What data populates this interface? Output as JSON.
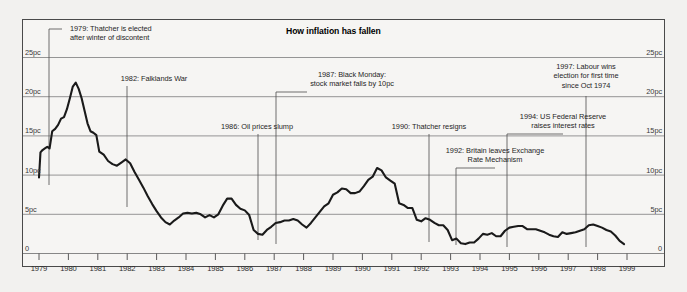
{
  "chart_data": {
    "type": "line",
    "title": "How inflation has fallen",
    "xlabel": "",
    "ylabel": "",
    "ylim": [
      0,
      27
    ],
    "xlim": [
      1979,
      1999.4
    ],
    "grid": true,
    "legend": "none",
    "y_ticks": [
      0,
      5,
      10,
      15,
      20,
      25
    ],
    "y_tick_labels": [
      "0",
      "5pc",
      "10pc",
      "15pc",
      "20pc",
      "25pc"
    ],
    "y_tick_labels_right": [
      "0",
      "5pc",
      "10pc",
      "15pc",
      "20pc",
      "25pc"
    ],
    "x_ticks": [
      1979,
      1980,
      1981,
      1982,
      1983,
      1984,
      1985,
      1986,
      1987,
      1988,
      1989,
      1990,
      1991,
      1992,
      1993,
      1994,
      1995,
      1996,
      1997,
      1998,
      1999
    ],
    "x_tick_labels": [
      "1979",
      "1980",
      "1981",
      "1982",
      "1983",
      "1984",
      "1985",
      "1986",
      "1987",
      "1988",
      "1989",
      "1990",
      "1991",
      "1992",
      "1993",
      "1994",
      "1995",
      "1996",
      "1997",
      "1998",
      "1999"
    ],
    "series": [
      {
        "name": "UK inflation rate",
        "units": "pc",
        "x": [
          1979.0,
          1979.05,
          1979.12,
          1979.2,
          1979.28,
          1979.36,
          1979.45,
          1979.55,
          1979.65,
          1979.75,
          1979.85,
          1979.95,
          1980.05,
          1980.15,
          1980.25,
          1980.35,
          1980.45,
          1980.55,
          1980.65,
          1980.75,
          1980.85,
          1980.95,
          1981.05,
          1981.2,
          1981.35,
          1981.5,
          1981.65,
          1981.8,
          1981.95,
          1982.1,
          1982.25,
          1982.4,
          1982.55,
          1982.7,
          1982.85,
          1983.0,
          1983.15,
          1983.3,
          1983.45,
          1983.6,
          1983.75,
          1983.9,
          1984.05,
          1984.2,
          1984.35,
          1984.5,
          1984.65,
          1984.8,
          1984.95,
          1985.1,
          1985.25,
          1985.4,
          1985.55,
          1985.7,
          1985.85,
          1986.0,
          1986.15,
          1986.3,
          1986.45,
          1986.6,
          1986.75,
          1986.9,
          1987.05,
          1987.2,
          1987.35,
          1987.5,
          1987.65,
          1987.8,
          1987.95,
          1988.1,
          1988.25,
          1988.4,
          1988.55,
          1988.7,
          1988.85,
          1989.0,
          1989.15,
          1989.3,
          1989.45,
          1989.6,
          1989.75,
          1989.9,
          1990.05,
          1990.2,
          1990.35,
          1990.5,
          1990.65,
          1990.8,
          1990.95,
          1991.1,
          1991.25,
          1991.4,
          1991.55,
          1991.7,
          1991.85,
          1992.0,
          1992.15,
          1992.3,
          1992.45,
          1992.6,
          1992.75,
          1992.9,
          1993.05,
          1993.2,
          1993.35,
          1993.5,
          1993.65,
          1993.8,
          1993.95,
          1994.1,
          1994.25,
          1994.4,
          1994.55,
          1994.7,
          1994.85,
          1995.0,
          1995.15,
          1995.3,
          1995.45,
          1995.6,
          1995.75,
          1995.9,
          1996.05,
          1996.2,
          1996.35,
          1996.5,
          1996.65,
          1996.8,
          1996.95,
          1997.1,
          1997.25,
          1997.4,
          1997.55,
          1997.7,
          1997.85,
          1998.0,
          1998.15,
          1998.3,
          1998.45,
          1998.6,
          1998.75,
          1998.9
        ],
        "y": [
          9.7,
          12.9,
          13.2,
          13.4,
          13.6,
          13.4,
          15.6,
          15.9,
          16.4,
          17.2,
          17.4,
          18.4,
          19.8,
          21.3,
          21.8,
          21.0,
          19.8,
          18.2,
          16.6,
          15.6,
          15.4,
          15.1,
          13.0,
          12.6,
          11.8,
          11.4,
          11.2,
          11.6,
          12.0,
          11.5,
          10.4,
          9.4,
          8.4,
          7.3,
          6.3,
          5.4,
          4.6,
          4.0,
          3.7,
          4.2,
          4.6,
          5.1,
          5.2,
          5.1,
          5.2,
          5.0,
          4.6,
          4.9,
          4.6,
          5.0,
          6.1,
          7.0,
          7.0,
          6.2,
          5.7,
          5.5,
          4.9,
          3.0,
          2.5,
          2.4,
          3.0,
          3.4,
          3.9,
          4.0,
          4.2,
          4.2,
          4.4,
          4.2,
          3.7,
          3.3,
          3.9,
          4.6,
          5.3,
          6.0,
          6.4,
          7.5,
          7.8,
          8.3,
          8.2,
          7.7,
          7.7,
          7.9,
          8.6,
          9.4,
          9.8,
          10.9,
          10.6,
          9.7,
          9.3,
          8.9,
          6.4,
          6.2,
          5.8,
          5.8,
          4.3,
          4.1,
          4.5,
          4.3,
          3.9,
          3.6,
          3.6,
          3.0,
          1.7,
          1.9,
          1.3,
          1.2,
          1.4,
          1.4,
          1.9,
          2.5,
          2.4,
          2.6,
          2.2,
          2.2,
          2.9,
          3.3,
          3.4,
          3.5,
          3.5,
          3.1,
          3.1,
          3.1,
          2.9,
          2.7,
          2.4,
          2.2,
          2.1,
          2.7,
          2.5,
          2.6,
          2.7,
          2.9,
          3.1,
          3.6,
          3.7,
          3.5,
          3.3,
          3.0,
          2.8,
          2.3,
          1.6,
          1.2
        ]
      }
    ],
    "annotations": [
      {
        "id": "thatcher-elected",
        "lines": [
          "1979: Thatcher is elected",
          "after winter of discontent"
        ],
        "year": 1979.1,
        "align": "left"
      },
      {
        "id": "falklands-war",
        "lines": [
          "1982: Falklands War"
        ],
        "year": 1982.0,
        "align": "center"
      },
      {
        "id": "oil-prices-slump",
        "lines": [
          "1986: Oil prices slump"
        ],
        "year": 1986.5,
        "align": "center"
      },
      {
        "id": "black-monday",
        "lines": [
          "1987: Black Monday:",
          "stock market falls by 10pc"
        ],
        "year": 1987.8,
        "align": "center"
      },
      {
        "id": "thatcher-resigns",
        "lines": [
          "1990: Thatcher resigns"
        ],
        "year": 1990.9,
        "align": "center"
      },
      {
        "id": "britain-leaves-erm",
        "lines": [
          "1992: Britain leaves Exchange",
          "Rate Mechanism"
        ],
        "year": 1992.6,
        "align": "center"
      },
      {
        "id": "us-federal-reserve",
        "lines": [
          "1994: US Federal Reserve",
          "raises interest rates"
        ],
        "year": 1994.4,
        "align": "center"
      },
      {
        "id": "labour-wins",
        "lines": [
          "1997: Labour wins",
          "election for first time",
          "since Oct 1974"
        ],
        "year": 1997.2,
        "align": "center"
      }
    ]
  }
}
